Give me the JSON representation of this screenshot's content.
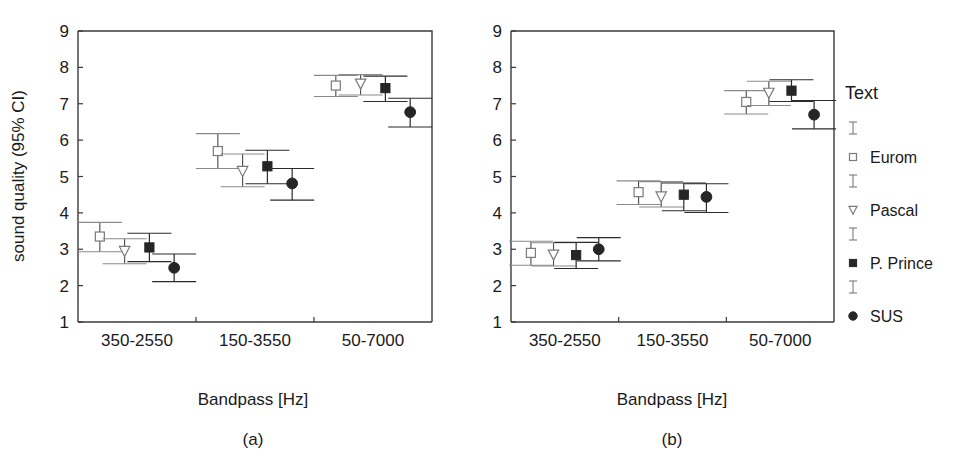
{
  "figure": {
    "panels": [
      {
        "id": "a",
        "caption": "(a)"
      },
      {
        "id": "b",
        "caption": "(b)"
      }
    ],
    "ylabel": "sound quality (95% CI)",
    "xlabel": "Bandpass [Hz]"
  },
  "legend": {
    "title": "Text",
    "entries": [
      {
        "label": "Eurom",
        "marker": "open-square",
        "errorbar_icon": "errorbar-icon"
      },
      {
        "label": "Pascal",
        "marker": "open-triangle-down",
        "errorbar_icon": "errorbar-icon"
      },
      {
        "label": "P. Prince",
        "marker": "filled-square",
        "errorbar_icon": "errorbar-icon"
      },
      {
        "label": "SUS",
        "marker": "filled-circle",
        "errorbar_icon": "errorbar-icon"
      }
    ]
  },
  "chart_data": [
    {
      "type": "scatter",
      "panel": "a",
      "title": "(a)",
      "xlabel": "Bandpass [Hz]",
      "ylabel": "sound quality (95% CI)",
      "ylim": [
        1,
        9
      ],
      "yticks": [
        1,
        2,
        3,
        4,
        5,
        6,
        7,
        8,
        9
      ],
      "categories": [
        "350-2550",
        "150-3550",
        "50-7000"
      ],
      "grid": false,
      "legend_position": "right",
      "series": [
        {
          "name": "Eurom",
          "marker": "open-square",
          "values": [
            3.35,
            5.7,
            7.5
          ],
          "ci_low": [
            2.93,
            5.22,
            7.2
          ],
          "ci_high": [
            3.74,
            6.18,
            7.78
          ]
        },
        {
          "name": "Pascal",
          "marker": "open-triangle-down",
          "values": [
            2.95,
            5.15,
            7.55
          ],
          "ci_low": [
            2.6,
            4.72,
            7.24
          ],
          "ci_high": [
            3.29,
            5.62,
            7.8
          ]
        },
        {
          "name": "P. Prince",
          "marker": "filled-square",
          "values": [
            3.05,
            5.28,
            7.43
          ],
          "ci_low": [
            2.66,
            4.8,
            7.06
          ],
          "ci_high": [
            3.44,
            5.72,
            7.76
          ]
        },
        {
          "name": "SUS",
          "marker": "filled-circle",
          "values": [
            2.49,
            4.81,
            6.77
          ],
          "ci_low": [
            2.11,
            4.35,
            6.36
          ],
          "ci_high": [
            2.87,
            5.22,
            7.15
          ]
        }
      ]
    },
    {
      "type": "scatter",
      "panel": "b",
      "title": "(b)",
      "xlabel": "Bandpass [Hz]",
      "ylabel": "sound quality (95% CI)",
      "ylim": [
        1,
        9
      ],
      "yticks": [
        1,
        2,
        3,
        4,
        5,
        6,
        7,
        8,
        9
      ],
      "categories": [
        "350-2550",
        "150-3550",
        "50-7000"
      ],
      "grid": false,
      "legend_position": "right",
      "series": [
        {
          "name": "Eurom",
          "marker": "open-square",
          "values": [
            2.9,
            4.57,
            7.05
          ],
          "ci_low": [
            2.56,
            4.23,
            6.72
          ],
          "ci_high": [
            3.22,
            4.88,
            7.36
          ]
        },
        {
          "name": "Pascal",
          "marker": "open-triangle-down",
          "values": [
            2.85,
            4.45,
            7.3
          ],
          "ci_low": [
            2.54,
            4.16,
            6.95
          ],
          "ci_high": [
            3.18,
            4.86,
            7.62
          ]
        },
        {
          "name": "P. Prince",
          "marker": "filled-square",
          "values": [
            2.84,
            4.5,
            7.36
          ],
          "ci_low": [
            2.47,
            4.06,
            7.06
          ],
          "ci_high": [
            3.19,
            4.82,
            7.66
          ]
        },
        {
          "name": "SUS",
          "marker": "filled-circle",
          "values": [
            3.0,
            4.44,
            6.7
          ],
          "ci_low": [
            2.68,
            4.01,
            6.31
          ],
          "ci_high": [
            3.32,
            4.8,
            7.09
          ]
        }
      ]
    }
  ]
}
